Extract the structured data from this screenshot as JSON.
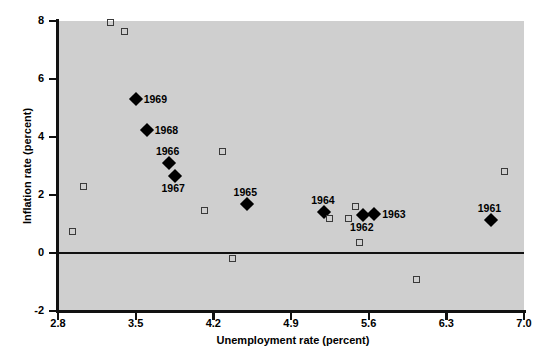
{
  "chart_data": {
    "type": "scatter",
    "title": "",
    "xlabel": "Unemployment rate (percent)",
    "ylabel": "Inflation rate (percent)",
    "xlim": [
      2.8,
      7.0
    ],
    "ylim": [
      -2,
      8
    ],
    "xticks": [
      "2.8",
      "3.5",
      "4.2",
      "4.9",
      "5.6",
      "6.3",
      "7.0"
    ],
    "yticks": [
      "8",
      "6",
      "4",
      "2",
      "0",
      "-2"
    ],
    "grid": false,
    "legend": "none",
    "plot_background": "#cfcfcf",
    "zero_reference_line": 0,
    "series": [
      {
        "name": "Labeled years (filled diamonds)",
        "marker": "filled-diamond",
        "color": "#000000",
        "points": [
          {
            "label": "1969",
            "x": 3.5,
            "y": 5.3,
            "label_pos": "right"
          },
          {
            "label": "1968",
            "x": 3.6,
            "y": 4.25,
            "label_pos": "right"
          },
          {
            "label": "1966",
            "x": 3.8,
            "y": 3.1,
            "label_pos": "above"
          },
          {
            "label": "1967",
            "x": 3.85,
            "y": 2.65,
            "label_pos": "below"
          },
          {
            "label": "1965",
            "x": 4.5,
            "y": 1.7,
            "label_pos": "above"
          },
          {
            "label": "1964",
            "x": 5.2,
            "y": 1.4,
            "label_pos": "above"
          },
          {
            "label": "1962",
            "x": 5.55,
            "y": 1.3,
            "label_pos": "below"
          },
          {
            "label": "1963",
            "x": 5.65,
            "y": 1.35,
            "label_pos": "right"
          },
          {
            "label": "1961",
            "x": 6.7,
            "y": 1.15,
            "label_pos": "above"
          }
        ]
      },
      {
        "name": "Other observations (open squares)",
        "marker": "open-square",
        "color": "#3a3a3a",
        "points": [
          {
            "x": 3.27,
            "y": 7.95
          },
          {
            "x": 3.4,
            "y": 7.65
          },
          {
            "x": 3.03,
            "y": 2.3
          },
          {
            "x": 2.93,
            "y": 0.75
          },
          {
            "x": 4.28,
            "y": 3.5
          },
          {
            "x": 4.12,
            "y": 1.45
          },
          {
            "x": 4.37,
            "y": -0.2
          },
          {
            "x": 5.25,
            "y": 1.2
          },
          {
            "x": 5.48,
            "y": 1.62
          },
          {
            "x": 5.42,
            "y": 1.2
          },
          {
            "x": 5.52,
            "y": 0.35
          },
          {
            "x": 6.03,
            "y": -0.9
          },
          {
            "x": 6.82,
            "y": 2.8
          }
        ]
      }
    ]
  },
  "axes": {
    "x_title": "Unemployment rate (percent)",
    "y_title": "Inflation rate (percent)"
  }
}
